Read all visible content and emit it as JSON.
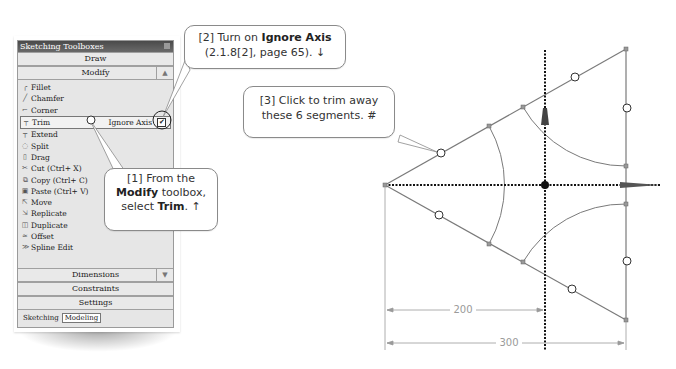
{
  "toolbox": {
    "title": "Sketching Toolboxes",
    "sections": {
      "draw": "Draw",
      "modify": "Modify",
      "dimensions": "Dimensions",
      "constraints": "Constraints",
      "settings": "Settings"
    },
    "collapse_glyph": "▲",
    "expand_glyph": "▼",
    "tools": [
      {
        "label": "Fillet",
        "icon": "fillet-icon",
        "glyph": "╭"
      },
      {
        "label": "Chamfer",
        "icon": "chamfer-icon",
        "glyph": "╱"
      },
      {
        "label": "Corner",
        "icon": "corner-icon",
        "glyph": "⌐"
      },
      {
        "label": "Trim",
        "icon": "trim-icon",
        "glyph": "┬",
        "selected": true
      },
      {
        "label": "Extend",
        "icon": "extend-icon",
        "glyph": "┬"
      },
      {
        "label": "Split",
        "icon": "split-icon",
        "glyph": "◌"
      },
      {
        "label": "Drag",
        "icon": "drag-icon",
        "glyph": "▯"
      },
      {
        "label": "Cut (Ctrl+ X)",
        "icon": "cut-icon",
        "glyph": "✂"
      },
      {
        "label": "Copy (Ctrl+ C)",
        "icon": "copy-icon",
        "glyph": "⧉"
      },
      {
        "label": "Paste (Ctrl+ V)",
        "icon": "paste-icon",
        "glyph": "▣"
      },
      {
        "label": "Move",
        "icon": "move-icon",
        "glyph": "⇱"
      },
      {
        "label": "Replicate",
        "icon": "replicate-icon",
        "glyph": "⇲"
      },
      {
        "label": "Duplicate",
        "icon": "duplicate-icon",
        "glyph": "◫"
      },
      {
        "label": "Offset",
        "icon": "offset-icon",
        "glyph": "≈"
      },
      {
        "label": "Spline Edit",
        "icon": "spline-edit-icon",
        "glyph": "≫"
      }
    ],
    "ignore_axis_label": "Ignore Axis",
    "ignore_axis_checked": "✔",
    "tabs": [
      "Sketching",
      "Modeling"
    ],
    "active_tab": "Modeling"
  },
  "callouts": {
    "step1": {
      "prefix": "[1] From the",
      "bold1": "Modify",
      "mid": " toolbox,",
      "line3a": "select ",
      "bold2": "Trim",
      "suffix": ". ↑"
    },
    "step2": {
      "prefix": "[2] Turn on ",
      "bold": "Ignore Axis",
      "line2": "(2.1.8[2], page 65). ↓"
    },
    "step3": {
      "line1": "[3] Click to trim away",
      "line2": "these 6 segments. #"
    }
  },
  "sketch": {
    "dimension_200": "200",
    "dimension_300": "300",
    "line_color": "#7a7a7a",
    "axis_color": "#111111"
  }
}
